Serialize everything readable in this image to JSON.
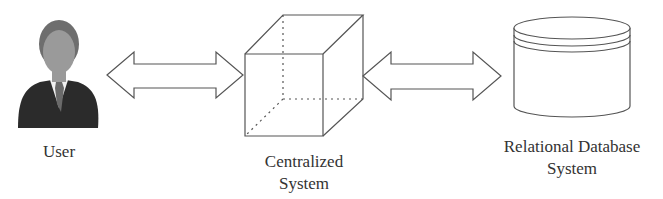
{
  "diagram": {
    "nodes": [
      {
        "id": "user",
        "label_lines": [
          "User"
        ],
        "icon": "user-avatar-icon"
      },
      {
        "id": "central",
        "label_lines": [
          "Centralized",
          "System"
        ],
        "icon": "cube-icon"
      },
      {
        "id": "db",
        "label_lines": [
          "Relational Database",
          "System"
        ],
        "icon": "database-cylinder-icon"
      }
    ],
    "edges": [
      {
        "from": "user",
        "to": "central",
        "type": "bidirectional-arrow"
      },
      {
        "from": "central",
        "to": "db",
        "type": "bidirectional-arrow"
      }
    ]
  },
  "colors": {
    "stroke": "#555555",
    "suit": "#2b2b2b",
    "face": "#9a9a9a",
    "hair": "#6e6e6e"
  }
}
